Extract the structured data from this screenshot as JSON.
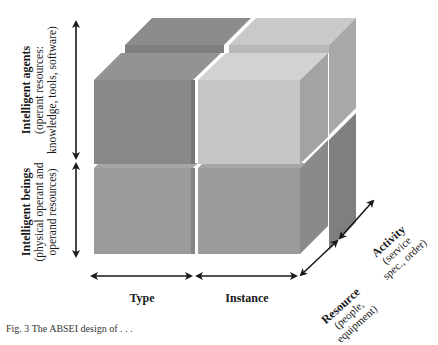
{
  "figure": {
    "type": "3D cube diagram (2x2x2 stacked blocks)",
    "vertical_axis": {
      "upper": {
        "title": "Intelligent agents",
        "subtitle_line1": "(operant resources:",
        "subtitle_line2": "knowledge, tools, software)"
      },
      "lower": {
        "title": "Intelligent beings",
        "subtitle_line1": "(physical operant and",
        "subtitle_line2": "operand resources)"
      }
    },
    "horizontal_axis": {
      "left": {
        "title": "Type"
      },
      "right": {
        "title": "Instance"
      }
    },
    "depth_axis": {
      "front": {
        "title": "Resource",
        "subtitle_line1": "(people,",
        "subtitle_line2": "equipment)"
      },
      "back": {
        "title": "Activity",
        "subtitle_line1": "(service",
        "subtitle_line2": "spec., order)"
      }
    },
    "colors": {
      "dark_block": "#8a8a8a",
      "light_block": "#c6c6c6",
      "bottom_block": "#9b9b9b",
      "arrow": "#1a1a1a"
    },
    "caption": "Fig. 3   The ABSEI design of . . ."
  }
}
